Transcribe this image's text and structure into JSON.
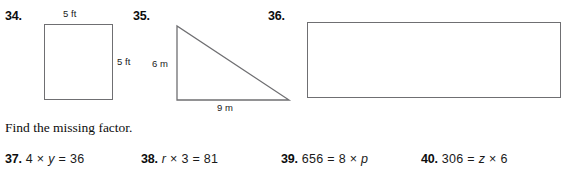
{
  "page": {
    "background": "#ffffff",
    "ink": "#1a1a1a",
    "shape_stroke": "#6f6f72"
  },
  "figures": [
    {
      "number": "34.",
      "shape": "square",
      "labels": [
        {
          "text": "5 ft",
          "position": "top"
        },
        {
          "text": "5 ft",
          "position": "right"
        }
      ]
    },
    {
      "number": "35.",
      "shape": "right-triangle",
      "labels": [
        {
          "text": "6 m",
          "position": "left"
        },
        {
          "text": "9 m",
          "position": "bottom"
        }
      ]
    },
    {
      "number": "36.",
      "shape": "rectangle",
      "labels": []
    }
  ],
  "instruction": "Find the missing factor.",
  "exercises": [
    {
      "number": "37.",
      "pre": "4 × ",
      "var": "y",
      "post": " = 36"
    },
    {
      "number": "38.",
      "pre": "",
      "var": "r",
      "post": " × 3 = 81"
    },
    {
      "number": "39.",
      "pre": "656 = 8 × ",
      "var": "p",
      "post": ""
    },
    {
      "number": "40.",
      "pre": "306 = ",
      "var": "z",
      "post": " × 6"
    }
  ]
}
